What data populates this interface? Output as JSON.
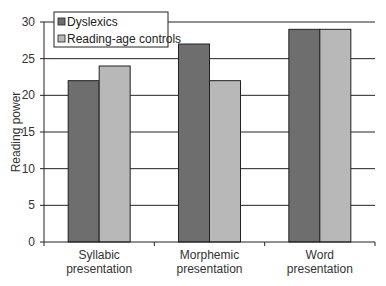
{
  "chart_data": {
    "type": "bar",
    "title": "",
    "xlabel": "",
    "ylabel": "Reading power",
    "ylim": [
      0,
      30
    ],
    "yticks": [
      0,
      5,
      10,
      15,
      20,
      25,
      30
    ],
    "grid": true,
    "legend_position": "top-left",
    "categories": [
      "Syllabic presentation",
      "Morphemic presentation",
      "Word presentation"
    ],
    "category_lines": [
      [
        "Syllabic",
        "presentation"
      ],
      [
        "Morphemic",
        "presentation"
      ],
      [
        "Word",
        "presentation"
      ]
    ],
    "series": [
      {
        "name": "Dyslexics",
        "color": "#6e6e6e",
        "values": [
          22,
          27,
          29
        ]
      },
      {
        "name": "Reading-age controls",
        "color": "#b8b8b8",
        "values": [
          24,
          22,
          29
        ]
      }
    ]
  }
}
